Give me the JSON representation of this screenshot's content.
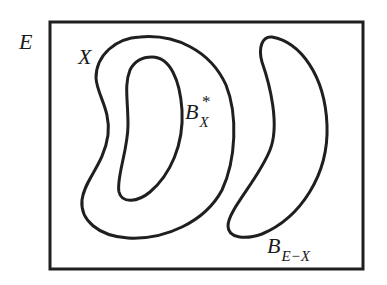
{
  "diagram": {
    "type": "set-diagram",
    "colors": {
      "stroke": "#1f1f1f",
      "background": "#ffffff",
      "text": "#1a1a1a"
    },
    "labels": {
      "universe": "E",
      "set_x": "X",
      "inner_base": "B",
      "inner_sub": "X",
      "inner_sup": "*",
      "complement_base": "B",
      "complement_sub": "E−X"
    },
    "regions": [
      {
        "id": "universe",
        "label": "E",
        "shape": "rectangle"
      },
      {
        "id": "set-x",
        "label": "X",
        "shape": "closed-curve"
      },
      {
        "id": "b-star-x",
        "label": "B*_X",
        "shape": "closed-curve",
        "inside": "set-x"
      },
      {
        "id": "b-e-minus-x",
        "label": "B_{E−X}",
        "shape": "closed-curve",
        "inside": "universe"
      }
    ]
  }
}
